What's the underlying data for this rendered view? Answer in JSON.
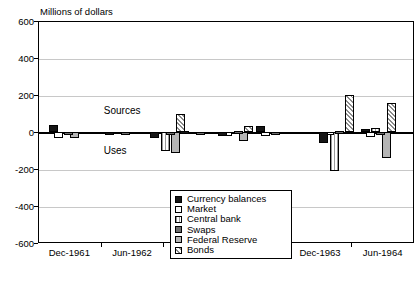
{
  "chart_data": {
    "type": "bar",
    "title": "",
    "ylabel": "Millions of dollars",
    "xlabel": "",
    "ylim": [
      -600,
      600
    ],
    "yticks": [
      600,
      400,
      200,
      0,
      -200,
      -400,
      -600
    ],
    "grid": true,
    "legend_position": "inside-bottom-center",
    "annotations": [
      {
        "text": "Sources",
        "x": "Dec-1962",
        "y": 110
      },
      {
        "text": "Uses",
        "x": "Dec-1962",
        "y": -110
      }
    ],
    "xticklabels": [
      "Dec-1961",
      "Jun-1962",
      "Dec-1962",
      "Jun-1963",
      "Dec-1963",
      "Jun-1964"
    ],
    "categories": [
      "1961Q4",
      "1962Q2",
      "1962Q4",
      "1963Q2",
      "1963Q3",
      "1963Q4",
      "1964Q2",
      "1964Q3"
    ],
    "series": [
      {
        "name": "Currency balances",
        "color": "#151515",
        "pattern": "solid",
        "values": [
          40,
          -6,
          -30,
          8,
          -22,
          30,
          -60,
          18
        ]
      },
      {
        "name": "Market",
        "color": "#ffffff",
        "pattern": "open",
        "values": [
          -34,
          0,
          0,
          0,
          -22,
          -24,
          -10,
          -28
        ]
      },
      {
        "name": "Central bank",
        "color": "#9a9a9a",
        "pattern": "vertical-stripe",
        "values": [
          0,
          0,
          -105,
          0,
          0,
          0,
          -210,
          20
        ]
      },
      {
        "name": "Swaps",
        "color": "#6e6e6e",
        "pattern": "solid",
        "values": [
          -8,
          -8,
          -14,
          -10,
          8,
          -14,
          8,
          -6
        ]
      },
      {
        "name": "Federal Reserve",
        "color": "#b5b5b5",
        "pattern": "solid",
        "values": [
          -32,
          0,
          -115,
          0,
          -48,
          0,
          0,
          -140
        ]
      },
      {
        "name": "Bonds",
        "color": "#8c8c8c",
        "pattern": "diagonal-hatch",
        "values": [
          0,
          0,
          95,
          0,
          30,
          0,
          200,
          155
        ]
      }
    ]
  },
  "legend": {
    "items": [
      {
        "label": "Currency balances",
        "swatch": "currency-swatch"
      },
      {
        "label": "Market",
        "swatch": "market-swatch"
      },
      {
        "label": "Central bank",
        "swatch": "central-bank-swatch"
      },
      {
        "label": "Swaps",
        "swatch": "swaps-swatch"
      },
      {
        "label": "Federal Reserve",
        "swatch": "federal-reserve-swatch"
      },
      {
        "label": "Bonds",
        "swatch": "bonds-swatch"
      }
    ]
  }
}
